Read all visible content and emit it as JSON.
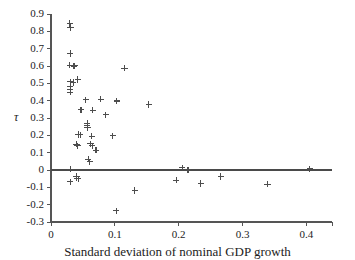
{
  "chart_data": {
    "type": "scatter",
    "title": "",
    "xlabel": "Standard deviation of nominal GDP growth",
    "ylabel": "τ",
    "xlim": [
      0,
      0.44
    ],
    "ylim": [
      -0.3,
      0.9
    ],
    "xticks": [
      0,
      0.1,
      0.2,
      0.3,
      0.4
    ],
    "xtick_labels": [
      "0",
      "0.1",
      "0.2",
      "0.3",
      "0.4"
    ],
    "yticks": [
      -0.3,
      -0.2,
      -0.1,
      0,
      0.1,
      0.2,
      0.3,
      0.4,
      0.5,
      0.6,
      0.7,
      0.8,
      0.9
    ],
    "ytick_labels": [
      "-0.3",
      "-0.2",
      "-0.1",
      "0",
      "0.1",
      "0.2",
      "0.3",
      "0.4",
      "0.5",
      "0.6",
      "0.7",
      "0.8",
      "0.9"
    ],
    "grid": false,
    "legend": null,
    "marker": "plus",
    "marker_color": "#4d4d4d",
    "axis_color": "#555555",
    "reference_lines": [
      {
        "name": "zero-line",
        "orientation": "horizontal",
        "y": 0,
        "color": "#4a4a4a"
      }
    ],
    "points": [
      {
        "x": 0.0295,
        "y": 0.845
      },
      {
        "x": 0.0305,
        "y": 0.822
      },
      {
        "x": 0.03,
        "y": 0.672
      },
      {
        "x": 0.0295,
        "y": 0.605
      },
      {
        "x": 0.0355,
        "y": 0.6
      },
      {
        "x": 0.0375,
        "y": 0.602
      },
      {
        "x": 0.115,
        "y": 0.588
      },
      {
        "x": 0.03,
        "y": 0.508
      },
      {
        "x": 0.035,
        "y": 0.505
      },
      {
        "x": 0.042,
        "y": 0.522
      },
      {
        "x": 0.03,
        "y": 0.48
      },
      {
        "x": 0.03,
        "y": 0.462
      },
      {
        "x": 0.03,
        "y": 0.448
      },
      {
        "x": 0.0545,
        "y": 0.405
      },
      {
        "x": 0.078,
        "y": 0.408
      },
      {
        "x": 0.103,
        "y": 0.398
      },
      {
        "x": 0.153,
        "y": 0.378
      },
      {
        "x": 0.047,
        "y": 0.348
      },
      {
        "x": 0.0655,
        "y": 0.345
      },
      {
        "x": 0.0855,
        "y": 0.318
      },
      {
        "x": 0.0565,
        "y": 0.268
      },
      {
        "x": 0.0565,
        "y": 0.255
      },
      {
        "x": 0.057,
        "y": 0.243
      },
      {
        "x": 0.043,
        "y": 0.205
      },
      {
        "x": 0.0455,
        "y": 0.203
      },
      {
        "x": 0.064,
        "y": 0.195
      },
      {
        "x": 0.0965,
        "y": 0.198
      },
      {
        "x": 0.04,
        "y": 0.148
      },
      {
        "x": 0.0415,
        "y": 0.14
      },
      {
        "x": 0.062,
        "y": 0.152
      },
      {
        "x": 0.0645,
        "y": 0.14
      },
      {
        "x": 0.0705,
        "y": 0.115
      },
      {
        "x": 0.058,
        "y": 0.062
      },
      {
        "x": 0.061,
        "y": 0.048
      },
      {
        "x": 0.0305,
        "y": 0.005
      },
      {
        "x": 0.2055,
        "y": 0.012
      },
      {
        "x": 0.2145,
        "y": 0.002
      },
      {
        "x": 0.4055,
        "y": 0.008
      },
      {
        "x": 0.04,
        "y": -0.038
      },
      {
        "x": 0.0405,
        "y": -0.048
      },
      {
        "x": 0.0425,
        "y": -0.05
      },
      {
        "x": 0.03,
        "y": -0.068
      },
      {
        "x": 0.196,
        "y": -0.058
      },
      {
        "x": 0.2345,
        "y": -0.078
      },
      {
        "x": 0.266,
        "y": -0.038
      },
      {
        "x": 0.339,
        "y": -0.082
      },
      {
        "x": 0.131,
        "y": -0.118
      },
      {
        "x": 0.102,
        "y": -0.235
      }
    ]
  }
}
